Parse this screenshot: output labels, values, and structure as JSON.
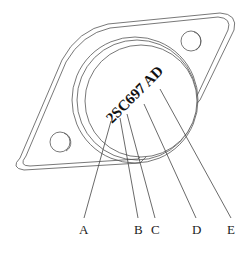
{
  "diagram": {
    "title": "",
    "component": "transistor-package",
    "marking": "2SC697 AD",
    "labels": [
      {
        "id": "A",
        "text": "A",
        "points_to": "2"
      },
      {
        "id": "B",
        "text": "B",
        "points_to": "S"
      },
      {
        "id": "C",
        "text": "C",
        "points_to": "C"
      },
      {
        "id": "D",
        "text": "D",
        "points_to": "697"
      },
      {
        "id": "E",
        "text": "E",
        "points_to": "AD"
      }
    ],
    "colors": {
      "line": "#555555",
      "text": "#222222",
      "background": "#ffffff"
    }
  }
}
